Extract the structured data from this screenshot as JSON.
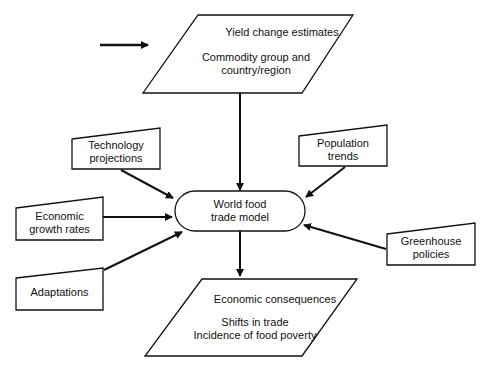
{
  "diagram": {
    "type": "flowchart",
    "colors": {
      "stroke": "#111111",
      "background": "#ffffff",
      "text": "#111111"
    },
    "nodes": {
      "yield": {
        "shape": "parallelogram",
        "title": "Yield change estimates",
        "line1": "Commodity group and",
        "line2": "country/region"
      },
      "technology": {
        "shape": "manual-input",
        "line1": "Technology",
        "line2": "projections"
      },
      "population": {
        "shape": "manual-input",
        "line1": "Population",
        "line2": "trends"
      },
      "economic_growth": {
        "shape": "manual-input",
        "line1": "Economic",
        "line2": "growth rates"
      },
      "model": {
        "shape": "terminator",
        "line1": "World food",
        "line2": "trade model"
      },
      "greenhouse": {
        "shape": "manual-input",
        "line1": "Greenhouse",
        "line2": "policies"
      },
      "adaptations": {
        "shape": "manual-input",
        "line1": "Adaptations"
      },
      "consequences": {
        "shape": "parallelogram",
        "title": "Economic consequences",
        "line1": "Shifts in trade",
        "line2": "Incidence of food poverty"
      }
    },
    "edges": [
      {
        "from": "external",
        "to": "yield"
      },
      {
        "from": "yield",
        "to": "model"
      },
      {
        "from": "technology",
        "to": "model"
      },
      {
        "from": "population",
        "to": "model"
      },
      {
        "from": "economic_growth",
        "to": "model"
      },
      {
        "from": "adaptations",
        "to": "model"
      },
      {
        "from": "greenhouse",
        "to": "model"
      },
      {
        "from": "model",
        "to": "consequences"
      }
    ]
  }
}
